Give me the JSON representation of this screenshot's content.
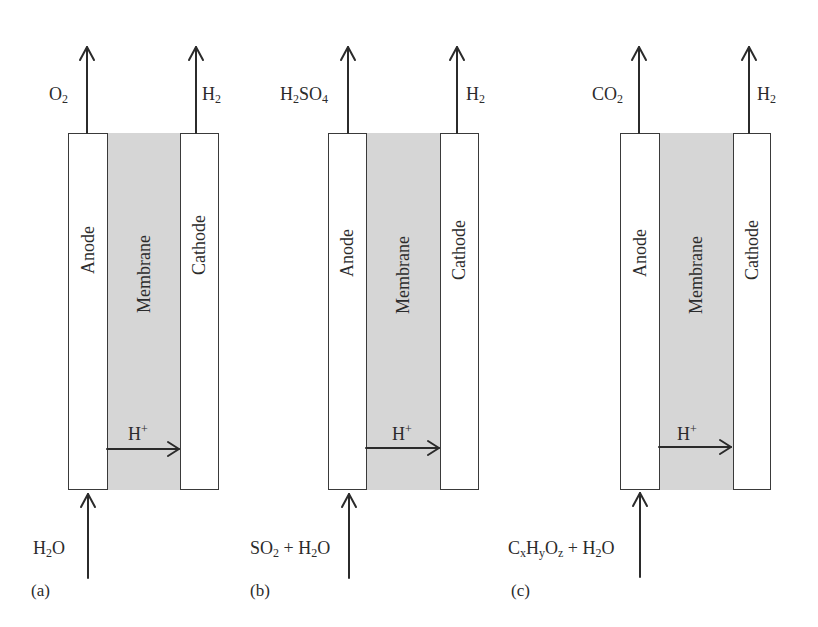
{
  "figure": {
    "panels": [
      {
        "id": "a",
        "letter": "(a)",
        "anode_label": "Anode",
        "membrane_label": "Membrane",
        "cathode_label": "Cathode",
        "anode_output": {
          "base": "O",
          "sub": "2",
          "rest": ""
        },
        "cathode_output": {
          "base": "H",
          "sub": "2"
        },
        "proton": {
          "base": "H",
          "sup": "+"
        },
        "anode_input_parts": [
          {
            "t": "H"
          },
          {
            "s": "2"
          },
          {
            "t": "O"
          }
        ]
      },
      {
        "id": "b",
        "letter": "(b)",
        "anode_label": "Anode",
        "membrane_label": "Membrane",
        "cathode_label": "Cathode",
        "anode_output_parts": [
          {
            "t": "H"
          },
          {
            "s": "2"
          },
          {
            "t": "SO"
          },
          {
            "s": "4"
          }
        ],
        "cathode_output": {
          "base": "H",
          "sub": "2"
        },
        "proton": {
          "base": "H",
          "sup": "+"
        },
        "anode_input_parts": [
          {
            "t": "SO"
          },
          {
            "s": "2"
          },
          {
            "t": " + H"
          },
          {
            "s": "2"
          },
          {
            "t": "O"
          }
        ]
      },
      {
        "id": "c",
        "letter": "(c)",
        "anode_label": "Anode",
        "membrane_label": "Membrane",
        "cathode_label": "Cathode",
        "anode_output_parts": [
          {
            "t": "CO"
          },
          {
            "s": "2"
          }
        ],
        "cathode_output": {
          "base": "H",
          "sub": "2"
        },
        "proton": {
          "base": "H",
          "sup": "+"
        },
        "anode_input_parts": [
          {
            "t": "C"
          },
          {
            "s": "x"
          },
          {
            "t": "H"
          },
          {
            "s": "y"
          },
          {
            "t": "O"
          },
          {
            "s": "z"
          },
          {
            "t": " + H"
          },
          {
            "s": "2"
          },
          {
            "t": "O"
          }
        ]
      }
    ],
    "colors": {
      "membrane_fill": "#d6d6d6",
      "line": "#3a3a3a",
      "background": "#ffffff"
    }
  }
}
